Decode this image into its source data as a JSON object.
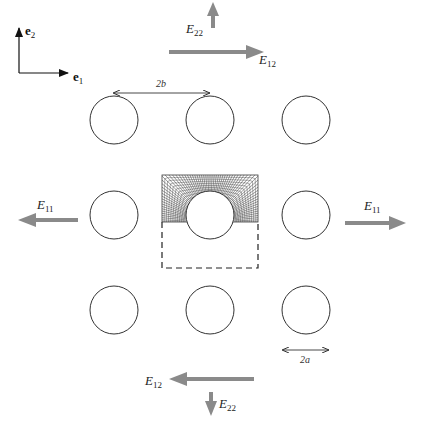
{
  "figure": {
    "basis": {
      "e1": {
        "base": "e",
        "sub": "1"
      },
      "e2": {
        "base": "e",
        "sub": "2"
      }
    },
    "strains": {
      "E11_left": {
        "base": "E",
        "sub": "11"
      },
      "E11_right": {
        "base": "E",
        "sub": "11"
      },
      "E12_top": {
        "base": "E",
        "sub": "12"
      },
      "E22_top": {
        "base": "E",
        "sub": "22"
      },
      "E12_bottom": {
        "base": "E",
        "sub": "12"
      },
      "E22_bottom": {
        "base": "E",
        "sub": "22"
      }
    },
    "dimensions": {
      "spacing": "2b",
      "diameter": "2a"
    },
    "lattice": {
      "rows": 3,
      "cols": 3,
      "centers_x": [
        114,
        210,
        306
      ],
      "centers_y": [
        120,
        215,
        310
      ],
      "radius": 24
    },
    "unit_cell": {
      "x": 162,
      "y": 175,
      "width": 96,
      "height": 93,
      "meshed_half": "upper",
      "dashed_half": "lower"
    },
    "colors": {
      "arrow_gray": "#8a8a8a",
      "line": "#333333",
      "mesh": "#3a3a3a"
    }
  }
}
